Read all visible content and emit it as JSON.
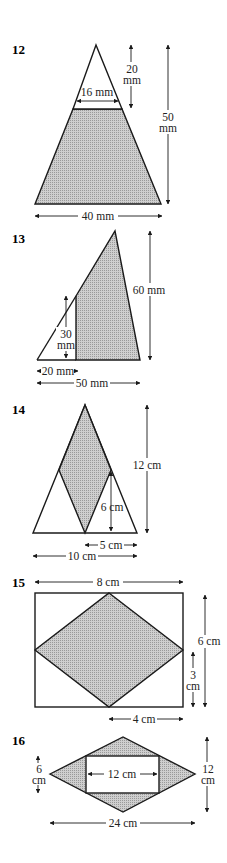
{
  "colors": {
    "shade": "#bdbdbd",
    "line": "#1a1a1a",
    "background": "#ffffff"
  },
  "problems": [
    {
      "number": "12",
      "shape": "triangle with top triangle cut off; lower trapezium shaded",
      "labels": {
        "top_height_value": "20",
        "top_height_unit": "mm",
        "cut_width": "16 mm",
        "total_height_value": "50",
        "total_height_unit": "mm",
        "base": "40 mm"
      }
    },
    {
      "number": "13",
      "shape": "triangle with left part cut by vertical line; right part shaded",
      "labels": {
        "height": "60 mm",
        "cut_height_value": "30",
        "cut_height_unit": "mm",
        "left_width": "20 mm",
        "base": "50 mm"
      }
    },
    {
      "number": "14",
      "shape": "isosceles triangle with shaded rhombus inside",
      "labels": {
        "height": "12 cm",
        "inner_height": "6 cm",
        "half_base": "5 cm",
        "base": "10 cm"
      }
    },
    {
      "number": "15",
      "shape": "rectangle with shaded rhombus joining side midpoints",
      "labels": {
        "width": "8 cm",
        "height": "6 cm",
        "half_height_value": "3",
        "half_height_unit": "cm",
        "half_width": "4 cm"
      }
    },
    {
      "number": "16",
      "shape": "rhombus with unshaded rectangle inside",
      "labels": {
        "rect_height_value": "6",
        "rect_height_unit": "cm",
        "rect_width": "12 cm",
        "height_value": "12",
        "height_unit": "cm",
        "width": "24 cm"
      }
    }
  ]
}
